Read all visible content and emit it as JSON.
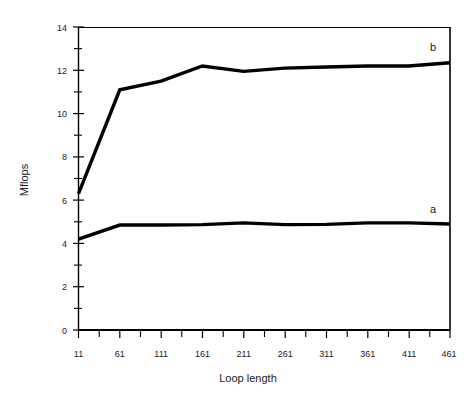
{
  "chart_data": {
    "type": "line",
    "title": "",
    "xlabel": "Loop length",
    "ylabel": "Mflops",
    "x": [
      11,
      61,
      111,
      161,
      211,
      261,
      311,
      361,
      411,
      461
    ],
    "xtick_labels": [
      "11",
      "61",
      "111",
      "161",
      "211",
      "261",
      "311",
      "361",
      "411",
      "461"
    ],
    "ytick_labels": [
      "0",
      "2",
      "4",
      "6",
      "8",
      "10",
      "12",
      "14"
    ],
    "yticks": [
      0,
      2,
      4,
      6,
      8,
      10,
      12,
      14
    ],
    "ylim": [
      0,
      14
    ],
    "xlim": [
      11,
      461
    ],
    "grid": false,
    "legend_position": "inline-right",
    "minor_ticks_x": true,
    "minor_ticks_y": true,
    "series": [
      {
        "name": "b",
        "label": "b",
        "color": "#000000",
        "values": [
          6.3,
          11.1,
          11.5,
          12.2,
          11.95,
          12.1,
          12.15,
          12.2,
          12.2,
          12.35
        ]
      },
      {
        "name": "a",
        "label": "a",
        "color": "#000000",
        "values": [
          4.2,
          4.85,
          4.85,
          4.87,
          4.95,
          4.87,
          4.88,
          4.95,
          4.95,
          4.9
        ]
      }
    ]
  },
  "axes": {
    "y_title": "Mflops",
    "x_title": "Loop length"
  },
  "annotations": {
    "label_b": "b",
    "label_a": "a"
  },
  "colors": {
    "line": "#000000",
    "axis": "#000000",
    "background": "#ffffff",
    "text": "#1a1a1a"
  }
}
